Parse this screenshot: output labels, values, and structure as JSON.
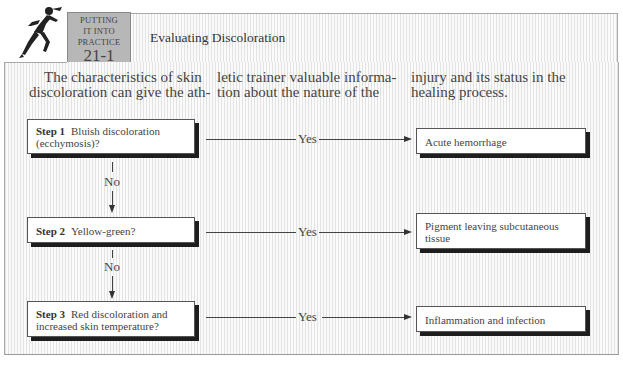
{
  "header": {
    "badge_line1": "PUTTING",
    "badge_line2": "IT INTO",
    "badge_line3": "PRACTICE",
    "badge_number": "21-1",
    "title": "Evaluating Discoloration",
    "icon": "runner-icon"
  },
  "intro": {
    "col1_line1": "The characteristics of skin",
    "col1_line2": "discoloration can give the ath-",
    "col2_line1": "letic trainer valuable informa-",
    "col2_line2": "tion about the nature of the",
    "col3_line1": "injury and its status in the",
    "col3_line2": "healing process."
  },
  "flowchart": {
    "steps": [
      {
        "label": "Step 1",
        "question_line1": "Bluish discoloration",
        "question_line2": "(ecchymosis)?",
        "yes_label": "Yes",
        "result_line1": "Acute hemorrhage",
        "result_line2": ""
      },
      {
        "label": "Step 2",
        "question_line1": "Yellow-green?",
        "question_line2": "",
        "yes_label": "Yes",
        "result_line1": "Pigment leaving subcutaneous",
        "result_line2": "tissue"
      },
      {
        "label": "Step 3",
        "question_line1": "Red discoloration and",
        "question_line2": "increased skin temperature?",
        "yes_label": "Yes",
        "result_line1": "Inflammation and infection",
        "result_line2": ""
      }
    ],
    "no_label": "No"
  },
  "colors": {
    "badge_bg": "#b7b7b7",
    "stripe": "#e3e3e3",
    "shadow": "#1e1e1e"
  }
}
